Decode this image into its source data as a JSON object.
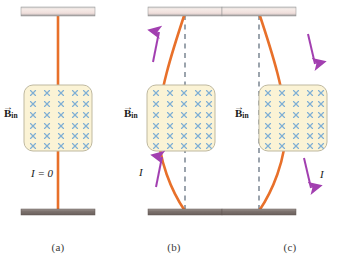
{
  "figure": {
    "type": "physics-diagram",
    "panel_count": 3
  },
  "colors": {
    "wire": "#E8702A",
    "wire_dark": "#D4601C",
    "field_fill": "#FBF3D5",
    "field_border": "#BFB9A0",
    "field_x": "#7FAFD4",
    "dashed_line": "#4A5A6A",
    "arrow_purple": "#A23FB0",
    "bar_top_light": "#F2E4E0",
    "bar_top_dark": "#8C8C8C",
    "bar_bottom_dark": "#6E6460",
    "caption_text": "#3a3a3a",
    "label_text": "#1a1a1a"
  },
  "field_region": {
    "rows": 6,
    "cols": 5,
    "glyph": "x-into-page",
    "glyph_name": "field-into-page-cross"
  },
  "panels": [
    {
      "id": "a",
      "caption": "(a)",
      "b_label_symbol": "B",
      "b_label_subscript": "in",
      "b_label_arrow": "→",
      "current_label": "I = 0",
      "current_value": "0",
      "current_direction": "none",
      "wire_shape": "straight",
      "has_dashed_reference": false,
      "arrows": []
    },
    {
      "id": "b",
      "caption": "(b)",
      "b_label_symbol": "B",
      "b_label_subscript": "in",
      "b_label_arrow": "→",
      "current_label": "I",
      "current_direction": "upward",
      "wire_shape": "bowed-left",
      "has_dashed_reference": true,
      "arrows": [
        {
          "name": "current-arrow-upper",
          "direction": "up"
        },
        {
          "name": "current-arrow-lower",
          "direction": "up"
        }
      ]
    },
    {
      "id": "c",
      "caption": "(c)",
      "b_label_symbol": "B",
      "b_label_subscript": "in",
      "b_label_arrow": "→",
      "current_label": "I",
      "current_direction": "downward",
      "wire_shape": "bowed-right",
      "has_dashed_reference": true,
      "arrows": [
        {
          "name": "current-arrow-upper",
          "direction": "down"
        },
        {
          "name": "current-arrow-lower",
          "direction": "down"
        }
      ]
    }
  ]
}
